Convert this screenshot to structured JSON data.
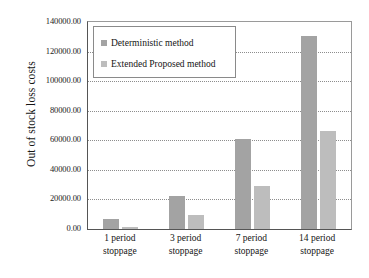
{
  "chart_data": {
    "type": "bar",
    "title": "",
    "xlabel": "",
    "ylabel": "Out of stock loss costs",
    "categories": [
      "1 period stoppage",
      "3 period stoppage",
      "7 period stoppage",
      "14 period stoppage"
    ],
    "category_lines": [
      [
        "1 period",
        "stoppage"
      ],
      [
        "3 period",
        "stoppage"
      ],
      [
        "7 period",
        "stoppage"
      ],
      [
        "14 period",
        "stoppage"
      ]
    ],
    "series": [
      {
        "name": "Deterministic method",
        "color": "#a3a3a3",
        "values": [
          7000.0,
          22500.0,
          61000.0,
          130500.0
        ]
      },
      {
        "name": "Extended Proposed method",
        "color": "#bdbdbd",
        "values": [
          1200.0,
          9500.0,
          29000.0,
          66000.0
        ]
      }
    ],
    "ylim": [
      0,
      140000
    ],
    "ytick_step": 20000,
    "ytick_labels": [
      "0.00",
      "20000.00",
      "40000.00",
      "60000.00",
      "80000.00",
      "100000.00",
      "120000.00",
      "140000.00"
    ],
    "ytick_values": [
      0,
      20000,
      40000,
      60000,
      80000,
      100000,
      120000,
      140000
    ],
    "grid": true,
    "grid_axis": "y",
    "legend_position": "top-left-inside",
    "legend_entries": [
      "Deterministic method",
      "Extended Proposed method"
    ]
  }
}
